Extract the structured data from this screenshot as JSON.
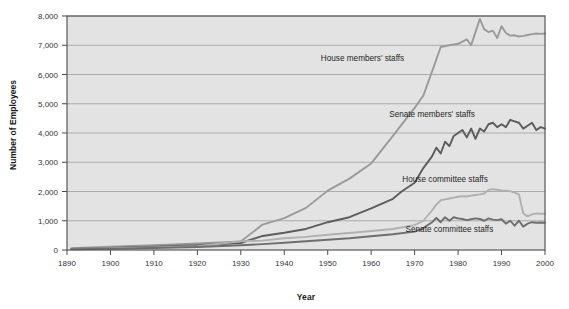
{
  "chart_data": {
    "type": "line",
    "title": "",
    "xlabel": "Year",
    "ylabel": "Number of Employees",
    "xlim": [
      1890,
      2000
    ],
    "ylim": [
      0,
      8000
    ],
    "grid": true,
    "legend_position": "inline-annotations",
    "xticks": [
      1890,
      1900,
      1910,
      1920,
      1930,
      1940,
      1950,
      1960,
      1970,
      1980,
      1990,
      2000
    ],
    "xtick_labels": [
      "1890",
      "1900",
      "1910",
      "1920",
      "1930",
      "1940",
      "1950",
      "1960",
      "1970",
      "1980",
      "1990",
      "2000"
    ],
    "yticks": [
      0,
      1000,
      2000,
      3000,
      4000,
      5000,
      6000,
      7000,
      8000
    ],
    "ytick_labels": [
      "0",
      "1,000",
      "2,000",
      "3,000",
      "4,000",
      "5,000",
      "6,000",
      "7,000",
      "8,000"
    ],
    "series": [
      {
        "name": "House members' staffs",
        "color": "#9a9a9a",
        "label_x": 1958,
        "label_y": 6450,
        "points": [
          [
            1891,
            60
          ],
          [
            1900,
            110
          ],
          [
            1910,
            160
          ],
          [
            1920,
            220
          ],
          [
            1930,
            290
          ],
          [
            1935,
            870
          ],
          [
            1940,
            1090
          ],
          [
            1945,
            1440
          ],
          [
            1950,
            2030
          ],
          [
            1955,
            2440
          ],
          [
            1960,
            2960
          ],
          [
            1965,
            3900
          ],
          [
            1970,
            4860
          ],
          [
            1972,
            5280
          ],
          [
            1974,
            6100
          ],
          [
            1976,
            6940
          ],
          [
            1978,
            7000
          ],
          [
            1980,
            7050
          ],
          [
            1982,
            7200
          ],
          [
            1983,
            7000
          ],
          [
            1984,
            7450
          ],
          [
            1985,
            7900
          ],
          [
            1986,
            7550
          ],
          [
            1987,
            7450
          ],
          [
            1988,
            7500
          ],
          [
            1989,
            7250
          ],
          [
            1990,
            7650
          ],
          [
            1991,
            7420
          ],
          [
            1992,
            7330
          ],
          [
            1993,
            7340
          ],
          [
            1994,
            7300
          ],
          [
            1995,
            7320
          ],
          [
            1996,
            7350
          ],
          [
            1997,
            7380
          ],
          [
            1998,
            7400
          ],
          [
            1999,
            7390
          ],
          [
            2000,
            7400
          ]
        ]
      },
      {
        "name": "Senate members' staffs",
        "color": "#5c5c5c",
        "label_x": 1974,
        "label_y": 4560,
        "points": [
          [
            1891,
            40
          ],
          [
            1900,
            70
          ],
          [
            1910,
            110
          ],
          [
            1920,
            160
          ],
          [
            1930,
            240
          ],
          [
            1935,
            480
          ],
          [
            1940,
            590
          ],
          [
            1945,
            720
          ],
          [
            1950,
            950
          ],
          [
            1955,
            1120
          ],
          [
            1960,
            1420
          ],
          [
            1965,
            1750
          ],
          [
            1967,
            2000
          ],
          [
            1970,
            2300
          ],
          [
            1972,
            2800
          ],
          [
            1974,
            3200
          ],
          [
            1975,
            3500
          ],
          [
            1976,
            3300
          ],
          [
            1977,
            3700
          ],
          [
            1978,
            3550
          ],
          [
            1979,
            3900
          ],
          [
            1980,
            4000
          ],
          [
            1981,
            4100
          ],
          [
            1982,
            3850
          ],
          [
            1983,
            4150
          ],
          [
            1984,
            3800
          ],
          [
            1985,
            4150
          ],
          [
            1986,
            4050
          ],
          [
            1987,
            4300
          ],
          [
            1988,
            4350
          ],
          [
            1989,
            4200
          ],
          [
            1990,
            4300
          ],
          [
            1991,
            4200
          ],
          [
            1992,
            4450
          ],
          [
            1993,
            4400
          ],
          [
            1994,
            4350
          ],
          [
            1995,
            4150
          ],
          [
            1996,
            4250
          ],
          [
            1997,
            4350
          ],
          [
            1998,
            4100
          ],
          [
            1999,
            4200
          ],
          [
            2000,
            4150
          ]
        ]
      },
      {
        "name": "House committee staffs",
        "color": "#b0b0b0",
        "label_x": 1977,
        "label_y": 2320,
        "points": [
          [
            1891,
            30
          ],
          [
            1900,
            60
          ],
          [
            1910,
            90
          ],
          [
            1920,
            130
          ],
          [
            1930,
            300
          ],
          [
            1935,
            320
          ],
          [
            1940,
            400
          ],
          [
            1945,
            450
          ],
          [
            1950,
            520
          ],
          [
            1955,
            580
          ],
          [
            1960,
            650
          ],
          [
            1965,
            720
          ],
          [
            1970,
            850
          ],
          [
            1972,
            1000
          ],
          [
            1974,
            1350
          ],
          [
            1975,
            1550
          ],
          [
            1976,
            1700
          ],
          [
            1977,
            1730
          ],
          [
            1978,
            1760
          ],
          [
            1979,
            1790
          ],
          [
            1980,
            1820
          ],
          [
            1981,
            1840
          ],
          [
            1982,
            1830
          ],
          [
            1983,
            1860
          ],
          [
            1984,
            1880
          ],
          [
            1985,
            1900
          ],
          [
            1986,
            1930
          ],
          [
            1987,
            2050
          ],
          [
            1988,
            2080
          ],
          [
            1989,
            2060
          ],
          [
            1990,
            2040
          ],
          [
            1991,
            2030
          ],
          [
            1992,
            2010
          ],
          [
            1993,
            1960
          ],
          [
            1994,
            1900
          ],
          [
            1995,
            1250
          ],
          [
            1996,
            1150
          ],
          [
            1997,
            1220
          ],
          [
            1998,
            1250
          ],
          [
            1999,
            1240
          ],
          [
            2000,
            1240
          ]
        ]
      },
      {
        "name": "Senate committee staffs",
        "color": "#6e6e6e",
        "label_x": 1978,
        "label_y": 620,
        "points": [
          [
            1891,
            25
          ],
          [
            1900,
            45
          ],
          [
            1910,
            70
          ],
          [
            1920,
            100
          ],
          [
            1930,
            160
          ],
          [
            1935,
            200
          ],
          [
            1940,
            250
          ],
          [
            1945,
            300
          ],
          [
            1950,
            350
          ],
          [
            1955,
            400
          ],
          [
            1960,
            470
          ],
          [
            1965,
            540
          ],
          [
            1970,
            630
          ],
          [
            1972,
            750
          ],
          [
            1974,
            950
          ],
          [
            1975,
            1100
          ],
          [
            1976,
            950
          ],
          [
            1977,
            1120
          ],
          [
            1978,
            1000
          ],
          [
            1979,
            1120
          ],
          [
            1980,
            1080
          ],
          [
            1981,
            1060
          ],
          [
            1982,
            1020
          ],
          [
            1983,
            1050
          ],
          [
            1984,
            1080
          ],
          [
            1985,
            1060
          ],
          [
            1986,
            1000
          ],
          [
            1987,
            1080
          ],
          [
            1988,
            1040
          ],
          [
            1989,
            1020
          ],
          [
            1990,
            1050
          ],
          [
            1991,
            900
          ],
          [
            1992,
            1000
          ],
          [
            1993,
            830
          ],
          [
            1994,
            1000
          ],
          [
            1995,
            800
          ],
          [
            1996,
            900
          ],
          [
            1997,
            950
          ],
          [
            1998,
            930
          ],
          [
            1999,
            940
          ],
          [
            2000,
            930
          ]
        ]
      }
    ]
  }
}
